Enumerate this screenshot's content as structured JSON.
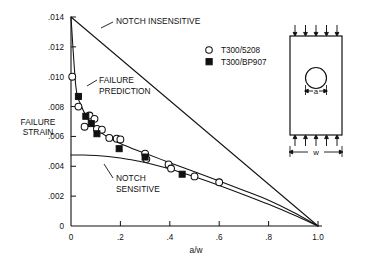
{
  "figure": {
    "axis_label_y_line1": "FAILURE",
    "axis_label_y_line2": "STRAIN",
    "axis_label_x": "a/w"
  },
  "legend": {
    "entries": [
      {
        "symbol": "open-circle",
        "label": "T300/5208"
      },
      {
        "symbol": "filled-square",
        "label": "T300/BP907"
      }
    ]
  },
  "annotations": {
    "notch_insensitive": "NOTCH INSENSITIVE",
    "failure_prediction_line1": "FAILURE",
    "failure_prediction_line2": "PREDICTION",
    "notch_sensitive_line1": "NOTCH",
    "notch_sensitive_line2": "SENSITIVE"
  },
  "specimen": {
    "hole_dim_label": "a",
    "width_dim_label": "w"
  },
  "chart_data": {
    "type": "scatter",
    "title": "",
    "xlabel": "a/w",
    "ylabel": "FAILURE STRAIN",
    "xlim": [
      0,
      1.0
    ],
    "ylim": [
      0,
      0.014
    ],
    "xticks": [
      0,
      0.2,
      0.4,
      0.6,
      0.8,
      1.0
    ],
    "xticklabels": [
      "0",
      ".2",
      ".4",
      ".6",
      ".8",
      "1.0"
    ],
    "yticks": [
      0,
      0.002,
      0.004,
      0.006,
      0.008,
      0.01,
      0.012,
      0.014
    ],
    "yticklabels": [
      "0",
      ".002",
      ".004",
      ".006",
      ".008",
      ".010",
      ".012",
      ".014"
    ],
    "grid": false,
    "legend_position": "upper-right",
    "series": [
      {
        "name": "T300/5208",
        "marker": "open-circle",
        "x": [
          0.005,
          0.03,
          0.055,
          0.075,
          0.095,
          0.105,
          0.125,
          0.155,
          0.185,
          0.2,
          0.3,
          0.305,
          0.395,
          0.405,
          0.5,
          0.6
        ],
        "y": [
          0.01,
          0.008,
          0.00665,
          0.0074,
          0.00718,
          0.0065,
          0.00645,
          0.0059,
          0.00585,
          0.0058,
          0.00485,
          0.00448,
          0.00412,
          0.00385,
          0.00332,
          0.00293
        ]
      },
      {
        "name": "T300/BP907",
        "marker": "filled-square",
        "x": [
          0.03,
          0.06,
          0.082,
          0.105,
          0.195,
          0.3,
          0.45
        ],
        "y": [
          0.00868,
          0.00735,
          0.00686,
          0.00618,
          0.00518,
          0.00462,
          0.00347
        ]
      }
    ],
    "curves": [
      {
        "name": "NOTCH INSENSITIVE",
        "style": "solid",
        "x": [
          0.0,
          1.0
        ],
        "y": [
          0.014,
          0.0
        ]
      },
      {
        "name": "NOTCH SENSITIVE",
        "style": "solid",
        "x": [
          0.0,
          0.05,
          0.1,
          0.15,
          0.2,
          0.25,
          0.3,
          0.4,
          0.5,
          0.6,
          0.7,
          0.8,
          0.9,
          1.0
        ],
        "y": [
          0.00475,
          0.00475,
          0.00472,
          0.00466,
          0.00456,
          0.00442,
          0.00425,
          0.00382,
          0.0033,
          0.00272,
          0.0021,
          0.00145,
          0.00075,
          0.0
        ]
      },
      {
        "name": "FAILURE PREDICTION",
        "style": "solid",
        "x": [
          0.0,
          0.02,
          0.04,
          0.06,
          0.08,
          0.1,
          0.15,
          0.2,
          0.25,
          0.3,
          0.4,
          0.5,
          0.6,
          0.7,
          0.8,
          0.9,
          1.0
        ],
        "y": [
          0.014,
          0.0093,
          0.00812,
          0.0074,
          0.0069,
          0.00652,
          0.00594,
          0.00552,
          0.00518,
          0.00487,
          0.00424,
          0.00364,
          0.00302,
          0.00238,
          0.00172,
          0.00092,
          0.0
        ]
      }
    ]
  }
}
